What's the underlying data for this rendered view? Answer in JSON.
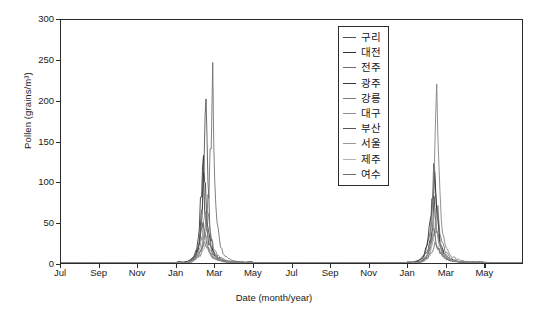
{
  "chart_data": {
    "type": "line",
    "title": "",
    "xlabel": "Date (month/year)",
    "ylabel": "Pollen (grains/m³)",
    "ylim": [
      0,
      300
    ],
    "yticks": [
      0,
      50,
      100,
      150,
      200,
      250,
      300
    ],
    "xticks": [
      "Jul",
      "Sep",
      "Nov",
      "Jan",
      "Mar",
      "May",
      "Jul",
      "Sep",
      "Nov",
      "Jan",
      "Mar",
      "May"
    ],
    "grid": false,
    "legend_position": "upper center",
    "x_range_months": [
      0,
      24
    ],
    "series": [
      {
        "name": "구리",
        "color": "#4f4f4f",
        "peak_year1": 196,
        "peak_year2": 131,
        "points": [
          [
            0,
            0
          ],
          [
            1,
            0
          ],
          [
            2,
            0
          ],
          [
            3,
            0
          ],
          [
            4,
            0
          ],
          [
            5,
            0
          ],
          [
            6,
            0
          ],
          [
            6.4,
            1
          ],
          [
            6.7,
            3
          ],
          [
            7.0,
            9
          ],
          [
            7.2,
            28
          ],
          [
            7.35,
            64
          ],
          [
            7.45,
            118
          ],
          [
            7.55,
            196
          ],
          [
            7.65,
            96
          ],
          [
            7.75,
            41
          ],
          [
            7.9,
            18
          ],
          [
            8.1,
            9
          ],
          [
            8.4,
            4
          ],
          [
            8.8,
            2
          ],
          [
            9.3,
            1
          ],
          [
            10,
            0
          ],
          [
            12,
            0
          ],
          [
            14,
            0
          ],
          [
            16,
            0
          ],
          [
            17.8,
            0
          ],
          [
            18.3,
            1
          ],
          [
            18.7,
            4
          ],
          [
            19.0,
            14
          ],
          [
            19.2,
            38
          ],
          [
            19.35,
            86
          ],
          [
            19.45,
            131
          ],
          [
            19.55,
            70
          ],
          [
            19.7,
            30
          ],
          [
            19.9,
            13
          ],
          [
            20.2,
            5
          ],
          [
            20.6,
            2
          ],
          [
            21.2,
            1
          ],
          [
            22,
            0
          ],
          [
            24,
            0
          ]
        ]
      },
      {
        "name": "대전",
        "color": "#2e2e2e",
        "peak_year1": 160,
        "peak_year2": 112,
        "points": [
          [
            0,
            0
          ],
          [
            2,
            0
          ],
          [
            4,
            0
          ],
          [
            6,
            0
          ],
          [
            6.5,
            1
          ],
          [
            6.8,
            4
          ],
          [
            7.05,
            16
          ],
          [
            7.2,
            45
          ],
          [
            7.32,
            95
          ],
          [
            7.42,
            160
          ],
          [
            7.52,
            88
          ],
          [
            7.62,
            44
          ],
          [
            7.8,
            19
          ],
          [
            8.0,
            9
          ],
          [
            8.3,
            4
          ],
          [
            8.8,
            1
          ],
          [
            9.5,
            0
          ],
          [
            12,
            0
          ],
          [
            16,
            0
          ],
          [
            18,
            0
          ],
          [
            18.4,
            1
          ],
          [
            18.8,
            5
          ],
          [
            19.05,
            20
          ],
          [
            19.22,
            52
          ],
          [
            19.35,
            90
          ],
          [
            19.45,
            112
          ],
          [
            19.58,
            58
          ],
          [
            19.75,
            24
          ],
          [
            19.95,
            10
          ],
          [
            20.3,
            4
          ],
          [
            20.8,
            1
          ],
          [
            21.5,
            0
          ],
          [
            24,
            0
          ]
        ]
      },
      {
        "name": "전주",
        "color": "#6b6b6b",
        "peak_year1": 212,
        "peak_year2": 60,
        "points": [
          [
            0,
            0
          ],
          [
            2,
            0
          ],
          [
            4,
            0
          ],
          [
            6,
            0
          ],
          [
            6.6,
            1
          ],
          [
            6.9,
            3
          ],
          [
            7.3,
            11
          ],
          [
            7.55,
            38
          ],
          [
            7.7,
            96
          ],
          [
            7.82,
            163
          ],
          [
            7.9,
            212
          ],
          [
            8.0,
            104
          ],
          [
            8.12,
            48
          ],
          [
            8.3,
            20
          ],
          [
            8.5,
            9
          ],
          [
            8.9,
            3
          ],
          [
            9.4,
            1
          ],
          [
            10,
            0
          ],
          [
            14,
            0
          ],
          [
            18,
            0
          ],
          [
            18.6,
            1
          ],
          [
            19.0,
            6
          ],
          [
            19.3,
            22
          ],
          [
            19.5,
            45
          ],
          [
            19.62,
            60
          ],
          [
            19.78,
            32
          ],
          [
            20.0,
            14
          ],
          [
            20.3,
            5
          ],
          [
            20.9,
            1
          ],
          [
            22,
            0
          ],
          [
            24,
            0
          ]
        ]
      },
      {
        "name": "광주",
        "color": "#3a3a3a",
        "peak_year1": 95,
        "peak_year2": 70,
        "points": [
          [
            0,
            0
          ],
          [
            2,
            0
          ],
          [
            4,
            0
          ],
          [
            6,
            0
          ],
          [
            6.6,
            1
          ],
          [
            6.95,
            5
          ],
          [
            7.15,
            20
          ],
          [
            7.3,
            55
          ],
          [
            7.42,
            95
          ],
          [
            7.55,
            52
          ],
          [
            7.7,
            25
          ],
          [
            7.9,
            11
          ],
          [
            8.2,
            5
          ],
          [
            8.6,
            2
          ],
          [
            9.2,
            0
          ],
          [
            12,
            0
          ],
          [
            16,
            0
          ],
          [
            18.3,
            0
          ],
          [
            18.8,
            2
          ],
          [
            19.1,
            12
          ],
          [
            19.28,
            38
          ],
          [
            19.42,
            70
          ],
          [
            19.58,
            36
          ],
          [
            19.78,
            16
          ],
          [
            20.1,
            6
          ],
          [
            20.6,
            2
          ],
          [
            21.4,
            0
          ],
          [
            24,
            0
          ]
        ]
      },
      {
        "name": "강릉",
        "color": "#7d7d7d",
        "peak_year1": 74,
        "peak_year2": 257,
        "points": [
          [
            0,
            0
          ],
          [
            2,
            0
          ],
          [
            4,
            0
          ],
          [
            6,
            0
          ],
          [
            6.8,
            1
          ],
          [
            7.1,
            6
          ],
          [
            7.35,
            24
          ],
          [
            7.5,
            50
          ],
          [
            7.62,
            74
          ],
          [
            7.78,
            40
          ],
          [
            7.95,
            18
          ],
          [
            8.2,
            8
          ],
          [
            8.6,
            3
          ],
          [
            9.2,
            1
          ],
          [
            10,
            0
          ],
          [
            14,
            0
          ],
          [
            18,
            0
          ],
          [
            18.7,
            1
          ],
          [
            19.05,
            8
          ],
          [
            19.28,
            40
          ],
          [
            19.42,
            110
          ],
          [
            19.5,
            190
          ],
          [
            19.56,
            257
          ],
          [
            19.66,
            120
          ],
          [
            19.8,
            52
          ],
          [
            20.0,
            22
          ],
          [
            20.3,
            9
          ],
          [
            20.8,
            3
          ],
          [
            21.6,
            1
          ],
          [
            24,
            0
          ]
        ]
      },
      {
        "name": "대구",
        "color": "#8e8e8e",
        "peak_year1": 58,
        "peak_year2": 48,
        "points": [
          [
            0,
            0
          ],
          [
            2,
            0
          ],
          [
            4,
            0
          ],
          [
            6,
            0
          ],
          [
            6.7,
            1
          ],
          [
            7.0,
            5
          ],
          [
            7.25,
            20
          ],
          [
            7.4,
            42
          ],
          [
            7.52,
            58
          ],
          [
            7.68,
            31
          ],
          [
            7.85,
            14
          ],
          [
            8.15,
            6
          ],
          [
            8.6,
            2
          ],
          [
            9.3,
            0
          ],
          [
            12,
            0
          ],
          [
            16,
            0
          ],
          [
            18.4,
            0
          ],
          [
            18.9,
            2
          ],
          [
            19.2,
            14
          ],
          [
            19.38,
            34
          ],
          [
            19.5,
            48
          ],
          [
            19.68,
            26
          ],
          [
            19.9,
            11
          ],
          [
            20.2,
            4
          ],
          [
            20.8,
            1
          ],
          [
            22,
            0
          ],
          [
            24,
            0
          ]
        ]
      },
      {
        "name": "부산",
        "color": "#555555",
        "peak_year1": 45,
        "peak_year2": 38,
        "points": [
          [
            0,
            0
          ],
          [
            2,
            0
          ],
          [
            4,
            0
          ],
          [
            6,
            0
          ],
          [
            6.5,
            1
          ],
          [
            6.9,
            6
          ],
          [
            7.1,
            18
          ],
          [
            7.28,
            34
          ],
          [
            7.4,
            45
          ],
          [
            7.58,
            24
          ],
          [
            7.8,
            10
          ],
          [
            8.1,
            4
          ],
          [
            8.6,
            1
          ],
          [
            9.4,
            0
          ],
          [
            12,
            0
          ],
          [
            16,
            0
          ],
          [
            18.2,
            0
          ],
          [
            18.7,
            2
          ],
          [
            19.0,
            12
          ],
          [
            19.25,
            28
          ],
          [
            19.4,
            38
          ],
          [
            19.6,
            20
          ],
          [
            19.85,
            8
          ],
          [
            20.2,
            3
          ],
          [
            20.9,
            1
          ],
          [
            24,
            0
          ]
        ]
      },
      {
        "name": "서울",
        "color": "#9a9a9a",
        "peak_year1": 38,
        "peak_year2": 62,
        "points": [
          [
            0,
            0
          ],
          [
            2,
            0
          ],
          [
            4,
            0
          ],
          [
            6,
            0
          ],
          [
            6.8,
            1
          ],
          [
            7.15,
            8
          ],
          [
            7.38,
            24
          ],
          [
            7.52,
            38
          ],
          [
            7.7,
            20
          ],
          [
            7.9,
            9
          ],
          [
            8.2,
            4
          ],
          [
            8.7,
            1
          ],
          [
            9.5,
            0
          ],
          [
            12,
            0
          ],
          [
            16,
            0
          ],
          [
            18.5,
            0
          ],
          [
            19.0,
            4
          ],
          [
            19.3,
            26
          ],
          [
            19.45,
            62
          ],
          [
            19.62,
            32
          ],
          [
            19.85,
            13
          ],
          [
            20.2,
            5
          ],
          [
            20.8,
            1
          ],
          [
            24,
            0
          ]
        ]
      },
      {
        "name": "제주",
        "color": "#b4b4b4",
        "peak_year1": 22,
        "peak_year2": 30,
        "points": [
          [
            0,
            0
          ],
          [
            2,
            0
          ],
          [
            4,
            0
          ],
          [
            6,
            0
          ],
          [
            6.6,
            1
          ],
          [
            7.0,
            5
          ],
          [
            7.3,
            14
          ],
          [
            7.5,
            22
          ],
          [
            7.75,
            12
          ],
          [
            8.0,
            6
          ],
          [
            8.4,
            2
          ],
          [
            9.0,
            1
          ],
          [
            10,
            0
          ],
          [
            14,
            0
          ],
          [
            18,
            0
          ],
          [
            18.8,
            1
          ],
          [
            19.2,
            10
          ],
          [
            19.45,
            30
          ],
          [
            19.7,
            16
          ],
          [
            20.0,
            7
          ],
          [
            20.5,
            2
          ],
          [
            21.5,
            0
          ],
          [
            24,
            0
          ]
        ]
      },
      {
        "name": "여수",
        "color": "#6f6f6f",
        "peak_year1": 30,
        "peak_year2": 26,
        "points": [
          [
            0,
            0
          ],
          [
            2,
            0
          ],
          [
            4,
            0
          ],
          [
            6,
            0
          ],
          [
            6.7,
            1
          ],
          [
            7.05,
            7
          ],
          [
            7.3,
            18
          ],
          [
            7.48,
            30
          ],
          [
            7.68,
            16
          ],
          [
            7.9,
            7
          ],
          [
            8.25,
            3
          ],
          [
            8.8,
            1
          ],
          [
            9.6,
            0
          ],
          [
            12,
            0
          ],
          [
            16,
            0
          ],
          [
            18.6,
            0
          ],
          [
            19.1,
            6
          ],
          [
            19.35,
            18
          ],
          [
            19.52,
            26
          ],
          [
            19.75,
            13
          ],
          [
            20.0,
            6
          ],
          [
            20.4,
            2
          ],
          [
            21.2,
            0
          ],
          [
            24,
            0
          ]
        ]
      }
    ]
  }
}
